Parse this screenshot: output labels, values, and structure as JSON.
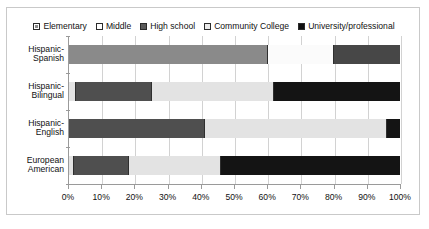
{
  "chart_data": {
    "type": "bar",
    "orientation": "horizontal",
    "stacked": true,
    "normalized_percent": true,
    "title": "",
    "subtitle": "",
    "xlabel": "",
    "ylabel": "",
    "xlim": [
      0,
      100
    ],
    "grid": true,
    "legend_position": "top",
    "categories": [
      "Hispanic-Spanish",
      "Hispanic-Bilingual",
      "Hispanic-English",
      "European American"
    ],
    "category_lines": [
      [
        "Hispanic-",
        "Spanish"
      ],
      [
        "Hispanic-",
        "Bilingual"
      ],
      [
        "Hispanic-",
        "English"
      ],
      [
        "European",
        "American"
      ]
    ],
    "xticks": [
      0,
      10,
      20,
      30,
      40,
      50,
      60,
      70,
      80,
      90,
      100
    ],
    "xtick_labels": [
      "0%",
      "10%",
      "20%",
      "30%",
      "40%",
      "50%",
      "60%",
      "70%",
      "80%",
      "90%",
      "100%"
    ],
    "series": [
      {
        "name": "Elementary",
        "swatch": "elementary",
        "values": [
          0,
          2,
          0,
          1.5
        ]
      },
      {
        "name": "Middle",
        "swatch": "middle",
        "values": [
          0,
          0,
          0,
          0
        ]
      },
      {
        "name": "High school",
        "swatch": "highschool",
        "values": [
          60,
          23,
          41,
          16.5
        ]
      },
      {
        "name": "Community College",
        "swatch": "community",
        "values": [
          20,
          37,
          55,
          28
        ]
      },
      {
        "name": "University/professional",
        "swatch": "university",
        "values": [
          20,
          38,
          4,
          54
        ]
      }
    ],
    "colors": {
      "elementary": "#cfcfcf",
      "middle": "#ffffff",
      "high_school": "#4f4f4f",
      "community_college": "#e3e3e3",
      "university_professional": "#141414",
      "gridline": "#d2d2d2",
      "axis": "#9a9a9a",
      "frame": "#c9c9c9",
      "text": "#111111"
    },
    "bars": [
      {
        "category": "Hispanic-Spanish",
        "segments": [
          {
            "series": "High school",
            "value": 60,
            "style": "seg-gray-mid"
          },
          {
            "series": "Community College",
            "value": 20,
            "style": "seg-white-band"
          },
          {
            "series": "University/professional",
            "value": 20,
            "style": "seg-dark-band"
          }
        ]
      },
      {
        "category": "Hispanic-Bilingual",
        "segments": [
          {
            "series": "Elementary",
            "value": 2,
            "style": "seg-community"
          },
          {
            "series": "High school",
            "value": 23,
            "style": "seg-highschool"
          },
          {
            "series": "Community College",
            "value": 37,
            "style": "seg-community"
          },
          {
            "series": "University/professional",
            "value": 38,
            "style": "seg-university"
          }
        ]
      },
      {
        "category": "Hispanic-English",
        "segments": [
          {
            "series": "High school",
            "value": 41,
            "style": "seg-highschool"
          },
          {
            "series": "Community College",
            "value": 55,
            "style": "seg-community"
          },
          {
            "series": "University/professional",
            "value": 4,
            "style": "seg-university"
          }
        ]
      },
      {
        "category": "European American",
        "segments": [
          {
            "series": "Elementary",
            "value": 1.5,
            "style": "seg-community"
          },
          {
            "series": "High school",
            "value": 16.5,
            "style": "seg-highschool"
          },
          {
            "series": "Community College",
            "value": 28,
            "style": "seg-community"
          },
          {
            "series": "University/professional",
            "value": 54,
            "style": "seg-university"
          }
        ]
      }
    ]
  },
  "legend": {
    "items": [
      {
        "label": "Elementary",
        "swatch_class": "sw-elementary"
      },
      {
        "label": "Middle",
        "swatch_class": "sw-middle"
      },
      {
        "label": "High school",
        "swatch_class": "sw-highschool"
      },
      {
        "label": "Community College",
        "swatch_class": "sw-community"
      },
      {
        "label": "University/professional",
        "swatch_class": "sw-university"
      }
    ]
  }
}
